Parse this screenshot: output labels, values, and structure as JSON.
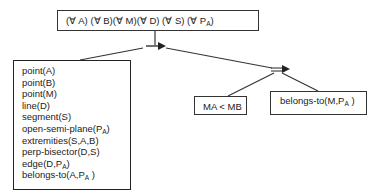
{
  "root": {
    "quantifiers": [
      {
        "label": "(∀ A)",
        "sub": ""
      },
      {
        "label": "(∀ B)",
        "sub": ""
      },
      {
        "label": "(∀ M)",
        "sub": ""
      },
      {
        "label": "(∀ D)",
        "sub": ""
      },
      {
        "label": "(∀ S)",
        "sub": ""
      },
      {
        "label": "(∀ P",
        "sub": "A",
        "close": ")"
      }
    ]
  },
  "hypotheses": {
    "items": [
      {
        "text": "point(A)"
      },
      {
        "text": "point(B)"
      },
      {
        "text": "point(M)"
      },
      {
        "text": "line(D)"
      },
      {
        "text": "segment(S)"
      },
      {
        "text": "open-semi-plane(P",
        "sub": "A",
        "close": ")"
      },
      {
        "text": "extremities(S,A,B)"
      },
      {
        "text": "perp-bisector(D,S)"
      },
      {
        "text": "edge(D,P",
        "sub": "A",
        "close": ")"
      },
      {
        "text": "belongs-to(A,P",
        "sub": "A",
        "close": " )"
      }
    ]
  },
  "conclusions": {
    "left": {
      "text": "MA < MB"
    },
    "right": {
      "text": "belongs-to(M,P",
      "sub": "A",
      "close": " )"
    }
  },
  "connectors": {
    "implication_symbol": "→",
    "equivalence_symbol": "="
  }
}
